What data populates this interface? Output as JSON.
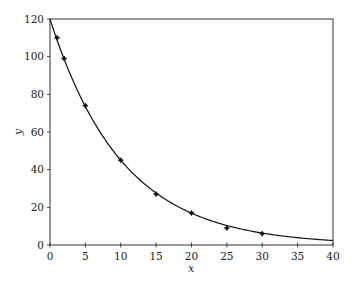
{
  "chart_data": {
    "type": "scatter",
    "title": "",
    "xlabel": "x",
    "ylabel": "y",
    "xlim": [
      0,
      40
    ],
    "ylim": [
      0,
      120
    ],
    "x_ticks": [
      0,
      5,
      10,
      15,
      20,
      25,
      30,
      35,
      40
    ],
    "y_ticks": [
      0,
      20,
      40,
      60,
      80,
      100,
      120
    ],
    "grid": false,
    "legend": null,
    "series": [
      {
        "name": "data",
        "kind": "scatter",
        "marker": "star",
        "x": [
          1,
          2,
          5,
          10,
          15,
          20,
          25,
          30
        ],
        "y": [
          110,
          99,
          74,
          45,
          27,
          17,
          9,
          6
        ]
      },
      {
        "name": "fit",
        "kind": "line",
        "model": "y = 120 * exp(-0.098 * x)",
        "a": 120,
        "k": 0.098,
        "x_range": [
          0,
          40
        ]
      }
    ]
  },
  "colors": {
    "frame": "#333333",
    "curve": "#111111",
    "marker": "#111111",
    "text": "#222222",
    "background": "#ffffff"
  }
}
